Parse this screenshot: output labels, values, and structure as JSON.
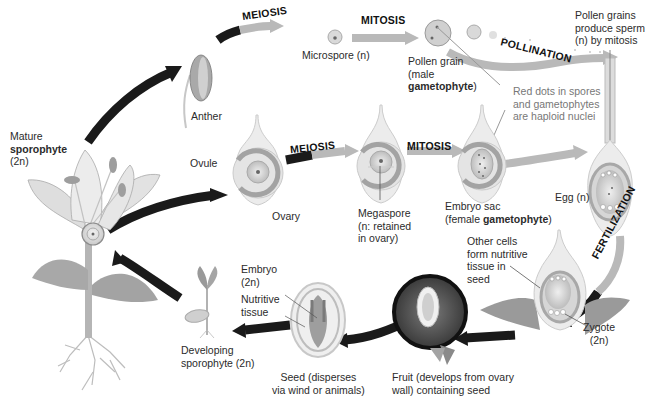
{
  "diagram": {
    "type": "angiosperm-life-cycle",
    "processes": {
      "meiosis_top": "MEIOSIS",
      "mitosis_top": "MITOSIS",
      "pollination": "POLLINATION",
      "meiosis_bottom": "MEIOSIS",
      "mitosis_bottom": "MITOSIS",
      "fertilization": "FERTILIZATION"
    },
    "labels": {
      "mature_sporophyte": {
        "line1": "Mature",
        "line2": "sporophyte",
        "line3": "(2n)"
      },
      "anther": "Anther",
      "microspore": "Microspore (n)",
      "pollen_grain": {
        "line1": "Pollen grain",
        "line2": "(male",
        "line3_bold": "gametophyte",
        "line3_end": ")"
      },
      "pollen_sperm": {
        "line1": "Pollen grains",
        "line2": "produce sperm",
        "line3": "(n) by mitosis"
      },
      "red_dots_note": {
        "line1": "Red dots in spores",
        "line2": "and gametophytes",
        "line3": "are haploid nuclei"
      },
      "ovule": "Ovule",
      "ovary": "Ovary",
      "megaspore": {
        "line1": "Megaspore",
        "line2": "(n: retained",
        "line3": "in ovary)"
      },
      "embryo_sac": {
        "line1": "Embryo sac",
        "line2_start": "(female ",
        "line2_bold": "gametophyte",
        "line2_end": ")"
      },
      "egg": "Egg (n)",
      "other_cells": {
        "line1": "Other cells",
        "line2": "form nutritive",
        "line3": "tissue in",
        "line4": "seed"
      },
      "zygote": {
        "line1": "Zygote",
        "line2": "(2n)"
      },
      "embryo": {
        "line1": "Embryo",
        "line2": "(2n)"
      },
      "nutritive_tissue": {
        "line1": "Nutritive",
        "line2": "tissue"
      },
      "developing_sporophyte": {
        "line1": "Developing",
        "line2": "sporophyte (2n)"
      },
      "seed": {
        "line1": "Seed (disperses",
        "line2": "via wind or animals)"
      },
      "fruit": {
        "line1": "Fruit (develops from ovary",
        "line2": "wall) containing seed"
      }
    },
    "colors": {
      "diploid_arrow": "#1a1a1a",
      "haploid_arrow": "#b9b9b9",
      "tissue_dark": "#8c8c8c",
      "tissue_light": "#d6d6d6",
      "note_text": "#777777"
    }
  }
}
